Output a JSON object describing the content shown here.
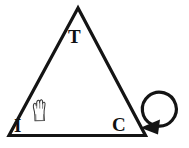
{
  "diagram": {
    "background_color": "#ffffff",
    "stroke_color": "#141414",
    "shape": {
      "name": "triangle",
      "type": "isosceles-outline",
      "vertices": [
        {
          "id": "apex",
          "label": "T",
          "x": 78,
          "y": 8
        },
        {
          "id": "bottom-left",
          "label": "I",
          "x": 8,
          "y": 136
        },
        {
          "id": "bottom-right",
          "label": "C",
          "x": 146,
          "y": 136
        }
      ]
    },
    "labels": {
      "top": "T",
      "bottom_left": "I",
      "bottom_right": "C"
    },
    "icons": {
      "hand": {
        "name": "hand-icon",
        "description": "open raised hand",
        "x": 31,
        "y": 99
      },
      "rotation": {
        "name": "rotate-arrow-icon",
        "description": "circular arrow with solid triangular arrowhead",
        "center_x": 163,
        "center_y": 110,
        "radius": 17
      }
    }
  }
}
